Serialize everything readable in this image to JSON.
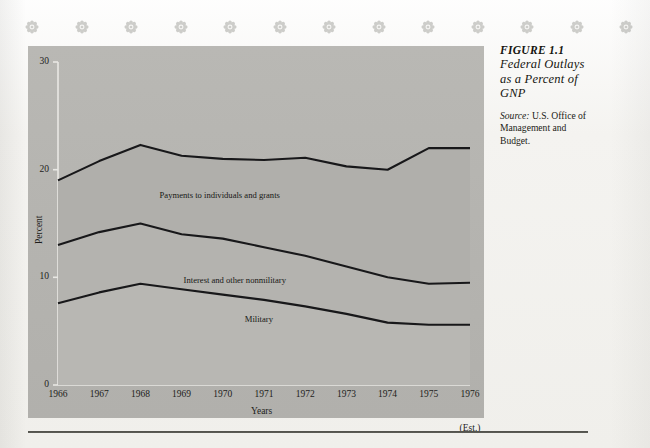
{
  "caption": {
    "figure_number": "FIGURE 1.1",
    "title": "Federal Outlays as a Percent of GNP",
    "title_lines": [
      "Federal Outlays",
      "as a Percent of",
      "GNP"
    ],
    "source_label": "Source:",
    "source_text": "U.S. Office of Management and Budget.",
    "source_lines": [
      "U.S. Office of",
      "Management and",
      "Budget."
    ]
  },
  "decor": {
    "icon_name": "flower-rosette-icon",
    "count": 13,
    "color": "#8e8e88"
  },
  "chart_data": {
    "type": "area",
    "xlabel": "Years",
    "ylabel": "Percent",
    "categories": [
      "1966",
      "1967",
      "1968",
      "1969",
      "1970",
      "1971",
      "1972",
      "1973",
      "1974",
      "1975",
      "1976"
    ],
    "x_note": "(Est.)",
    "x_note_category": "1976",
    "ylim": [
      0,
      30
    ],
    "yticks": [
      0,
      10,
      20,
      30
    ],
    "ytick_labels": [
      "0",
      "10",
      "20",
      "30"
    ],
    "grid": false,
    "legend_position": "inline-labels",
    "stacked": true,
    "series": [
      {
        "name": "Military",
        "label": "Military",
        "cumulative_values": [
          7.6,
          8.6,
          9.4,
          8.9,
          8.4,
          7.9,
          7.3,
          6.6,
          5.8,
          5.6,
          5.6
        ],
        "values": [
          7.6,
          8.6,
          9.4,
          8.9,
          8.4,
          7.9,
          7.3,
          6.6,
          5.8,
          5.6,
          5.6
        ]
      },
      {
        "name": "Interest and other nonmilitary",
        "label": "Interest and other nonmilitary",
        "cumulative_values": [
          13.0,
          14.2,
          15.0,
          14.0,
          13.6,
          12.8,
          12.0,
          11.0,
          10.0,
          9.4,
          9.5
        ],
        "values": [
          5.4,
          5.6,
          5.6,
          5.1,
          5.2,
          4.9,
          4.7,
          4.4,
          4.2,
          3.8,
          3.9
        ]
      },
      {
        "name": "Payments to individuals and grants",
        "label": "Payments to individuals and grants",
        "cumulative_values": [
          19.0,
          20.8,
          22.3,
          21.3,
          21.0,
          20.9,
          21.1,
          20.3,
          20.0,
          22.0,
          22.0
        ],
        "values": [
          6.0,
          6.6,
          7.3,
          7.3,
          7.4,
          8.1,
          9.1,
          9.3,
          10.0,
          12.6,
          12.5
        ]
      }
    ],
    "colors": {
      "panel": "#b7b6b2",
      "band_top": "#b0afab",
      "band_mid": "#b4b3af",
      "band_low": "#b8b7b3",
      "line": "#18181a",
      "axis": "#e9e8e4"
    }
  }
}
